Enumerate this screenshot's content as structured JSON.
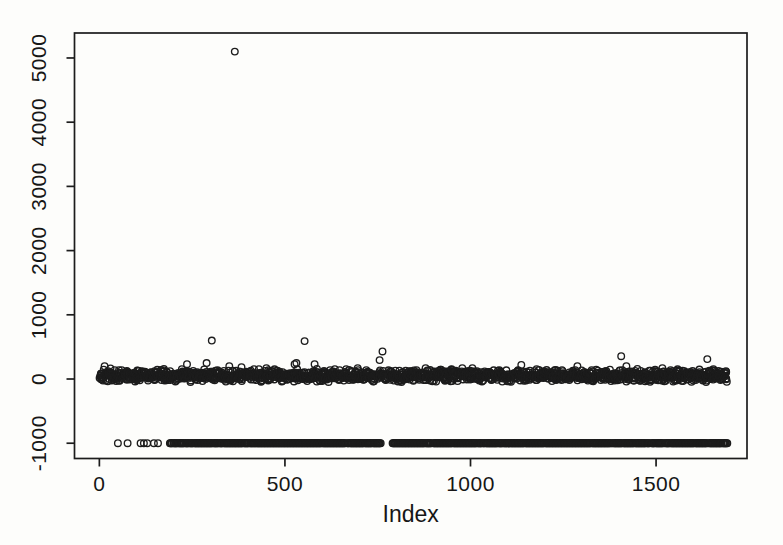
{
  "figure": {
    "background_color": "#fdfdfb",
    "axis_color": "#1c1c1c",
    "point_color": "#1c1c1c"
  },
  "chart_data": {
    "type": "scatter",
    "title": "",
    "xlabel": "Index",
    "ylabel": "",
    "legend": "none",
    "grid": false,
    "marker": {
      "shape": "open-circle",
      "radius": 3.3,
      "stroke_width": 1.35
    },
    "xlim": [
      -67,
      1745
    ],
    "ylim": [
      -1238,
      5389
    ],
    "x_ticks": [
      0,
      500,
      1000,
      1500
    ],
    "x_tick_labels": [
      "0",
      "500",
      "1000",
      "1500"
    ],
    "y_ticks": [
      -1000,
      0,
      1000,
      2000,
      3000,
      4000,
      5000
    ],
    "y_tick_labels": [
      "-1000",
      "0",
      "1000",
      "2000",
      "3000",
      "4000",
      "5000"
    ],
    "outliers": [
      [
        365,
        5100
      ],
      [
        14,
        200
      ],
      [
        30,
        165
      ],
      [
        236,
        230
      ],
      [
        289,
        250
      ],
      [
        303,
        600
      ],
      [
        350,
        200
      ],
      [
        383,
        185
      ],
      [
        450,
        170
      ],
      [
        526,
        230
      ],
      [
        531,
        250
      ],
      [
        553,
        590
      ],
      [
        580,
        230
      ],
      [
        696,
        170
      ],
      [
        755,
        295
      ],
      [
        763,
        430
      ],
      [
        879,
        170
      ],
      [
        949,
        155
      ],
      [
        978,
        170
      ],
      [
        1005,
        170
      ],
      [
        1137,
        220
      ],
      [
        1178,
        155
      ],
      [
        1205,
        140
      ],
      [
        1288,
        200
      ],
      [
        1366,
        125
      ],
      [
        1406,
        355
      ],
      [
        1420,
        200
      ],
      [
        1517,
        170
      ],
      [
        1638,
        310
      ],
      [
        1668,
        125
      ]
    ],
    "main_band": {
      "description": "dense band of values just above zero",
      "x_start": 1,
      "x_end": 1692,
      "count": 1650,
      "y_center": 55,
      "y_half_spread": 105,
      "seed": 20
    },
    "neg_row": {
      "description": "row of sentinel values at -1000",
      "y": -1000,
      "singles": [
        50,
        76,
        111,
        120,
        129,
        147,
        158
      ],
      "dense_segments": [
        [
          190,
          758
        ],
        [
          790,
          1692
        ]
      ],
      "step": 2
    }
  }
}
